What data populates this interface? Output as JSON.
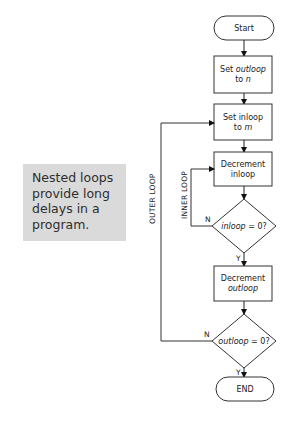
{
  "note": {
    "lines": [
      "Nested loops",
      "provide long",
      "delays in a",
      "program."
    ],
    "background": "#dadada"
  },
  "flowchart": {
    "start": "Start",
    "set_outloop": {
      "line1": "Set outloop",
      "line2": "to n",
      "var": "outloop",
      "val": "n"
    },
    "set_inloop": {
      "line1": "Set inloop",
      "line2": "to m",
      "var": "inloop",
      "val": "m"
    },
    "dec_inloop": {
      "line1": "Decrement",
      "line2": "inloop"
    },
    "inloop_check": {
      "var": "inloop",
      "rest": " = 0?",
      "no": "N",
      "yes": "Y"
    },
    "dec_outloop": {
      "line1": "Decrement",
      "line2": "outloop"
    },
    "outloop_check": {
      "var": "outloop",
      "rest": " = 0?",
      "no": "N",
      "yes": "Y"
    },
    "end": "END",
    "outer_loop_label": "OUTER LOOP",
    "inner_loop_label": "INNER LOOP"
  }
}
